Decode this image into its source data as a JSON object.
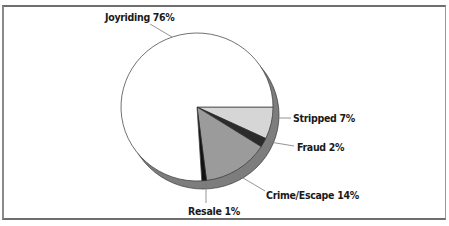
{
  "chart_data": {
    "type": "pie",
    "title": "",
    "style": "3d-extruded",
    "start_angle_deg": 0,
    "direction": "clockwise",
    "slices": [
      {
        "label": "Stripped",
        "value": 7,
        "display": "Stripped 7%",
        "color": "#d6d6d6"
      },
      {
        "label": "Fraud",
        "value": 2,
        "display": "Fraud 2%",
        "color": "#2b2b2b"
      },
      {
        "label": "Crime/Escape",
        "value": 14,
        "display": "Crime/Escape 14%",
        "color": "#9b9b9b"
      },
      {
        "label": "Resale",
        "value": 1,
        "display": "Resale 1%",
        "color": "#111111"
      },
      {
        "label": "Joyriding",
        "value": 76,
        "display": "Joyriding 76%",
        "color": "#ffffff"
      }
    ],
    "categories": [
      "Stripped",
      "Fraud",
      "Crime/Escape",
      "Resale",
      "Joyriding"
    ],
    "values": [
      7,
      2,
      14,
      1,
      76
    ],
    "unit": "%",
    "side_color": "#7d7d7d",
    "outline_color": "#333333"
  },
  "labels": {
    "joyriding": "Joyriding 76%",
    "stripped": "Stripped 7%",
    "fraud": "Fraud 2%",
    "crime_escape": "Crime/Escape 14%",
    "resale": "Resale 1%"
  }
}
